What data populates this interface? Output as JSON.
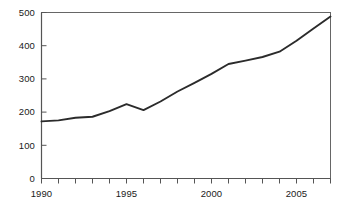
{
  "chart_data": {
    "type": "line",
    "title": "",
    "subtitle": "",
    "xlabel": "",
    "ylabel": "",
    "x": [
      1990,
      1991,
      1992,
      1993,
      1994,
      1995,
      1996,
      1997,
      1998,
      1999,
      2000,
      2001,
      2002,
      2003,
      2004,
      2005,
      2006,
      2007
    ],
    "values": [
      172,
      175,
      183,
      186,
      203,
      224,
      206,
      232,
      262,
      288,
      315,
      345,
      355,
      366,
      382,
      415,
      452,
      488
    ],
    "series": [
      {
        "name": "",
        "values": [
          172,
          175,
          183,
          186,
          203,
          224,
          206,
          232,
          262,
          288,
          315,
          345,
          355,
          366,
          382,
          415,
          452,
          488
        ]
      }
    ],
    "xlim": [
      1990,
      2007
    ],
    "ylim": [
      0,
      500
    ],
    "y_ticks": [
      0,
      100,
      200,
      300,
      400,
      500
    ],
    "y_tick_labels": [
      "0",
      "100",
      "200",
      "300",
      "400",
      "500"
    ],
    "x_ticks": [
      1990,
      1991,
      1992,
      1993,
      1994,
      1995,
      1996,
      1997,
      1998,
      1999,
      2000,
      2001,
      2002,
      2003,
      2004,
      2005,
      2006,
      2007
    ],
    "x_tick_labels_shown": [
      "1990",
      "1995",
      "2000",
      "2005"
    ],
    "x_labeled_values": [
      1990,
      1995,
      2000,
      2005
    ],
    "grid": false,
    "legend": false,
    "legend_position": "none",
    "line_color": "#2b2b2b",
    "axis_color": "#555555",
    "background_color": "#ffffff",
    "text_color": "#1a1a1a"
  },
  "axes": {
    "y_labels": [
      "500",
      "400",
      "300",
      "200",
      "100",
      "0"
    ],
    "x_labels": [
      "1990",
      "1995",
      "2000",
      "2005"
    ]
  }
}
